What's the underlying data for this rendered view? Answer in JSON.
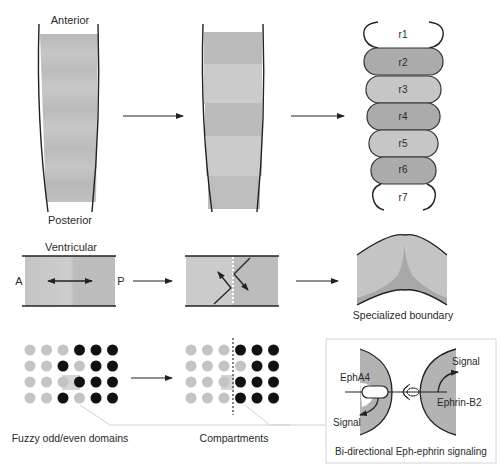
{
  "row1": {
    "panel1": {
      "top_label": "Anterior",
      "bottom_label": "Posterior"
    },
    "panel3": {
      "segments": [
        "r1",
        "r2",
        "r3",
        "r4",
        "r5",
        "r6",
        "r7"
      ]
    }
  },
  "row2": {
    "panel1": {
      "top_label": "Ventricular",
      "left_label": "A",
      "right_label": "P"
    },
    "panel3": {
      "caption": "Specialized boundary"
    }
  },
  "row3": {
    "panel1": {
      "caption": "Fuzzy odd/even domains",
      "grid": [
        [
          "light",
          "light",
          "light",
          "dark",
          "dark",
          "dark"
        ],
        [
          "light",
          "light",
          "dark",
          "light",
          "dark",
          "dark"
        ],
        [
          "light",
          "light",
          "light",
          "dark",
          "dark",
          "dark"
        ],
        [
          "light",
          "light",
          "dark",
          "light",
          "dark",
          "dark"
        ]
      ]
    },
    "panel2": {
      "caption": "Compartments",
      "grid": [
        [
          "light",
          "light",
          "light",
          "dark",
          "dark",
          "dark"
        ],
        [
          "light",
          "light",
          "light",
          "light",
          "dark",
          "dark"
        ],
        [
          "light",
          "light",
          "light",
          "dark",
          "dark",
          "dark"
        ],
        [
          "light",
          "light",
          "light",
          "dark",
          "dark",
          "dark"
        ]
      ]
    },
    "inset": {
      "caption": "Bi-directional Eph-ephrin signaling",
      "left_receptor": "EphA4",
      "right_ligand": "Ephrin-B2",
      "left_signal": "Signal",
      "right_signal": "Signal"
    }
  },
  "colors": {
    "tissue_light": "#cfcfcf",
    "tissue_mid": "#bdbdbd",
    "tissue_dark": "#a9a9a9",
    "dot_light": "#c4c4c4",
    "dot_dark": "#111111",
    "line": "#222222"
  }
}
